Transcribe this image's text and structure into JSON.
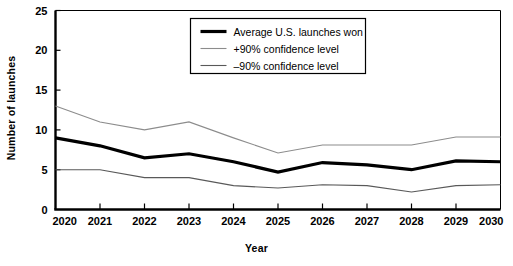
{
  "chart_data": {
    "type": "line",
    "title": "",
    "xlabel": "Year",
    "ylabel": "Number of launches",
    "categories": [
      "2020",
      "2021",
      "2022",
      "2023",
      "2024",
      "2025",
      "2026",
      "2027",
      "2028",
      "2029",
      "2030"
    ],
    "x": [
      2020,
      2021,
      2022,
      2023,
      2024,
      2025,
      2026,
      2027,
      2028,
      2029,
      2030
    ],
    "xlim": [
      2020,
      2030
    ],
    "ylim": [
      0,
      25
    ],
    "yticks": [
      0,
      5,
      10,
      15,
      20,
      25
    ],
    "ytick_labels": [
      "0",
      "5",
      "10",
      "15",
      "20",
      "25"
    ],
    "grid": false,
    "legend_position": "top-center",
    "series": [
      {
        "name": "Average U.S. launches won",
        "values": [
          9,
          8,
          6.5,
          7,
          6,
          4.7,
          5.9,
          5.6,
          5,
          6.1,
          6
        ],
        "color": "#000000",
        "width": 3.2
      },
      {
        "name": "+90% confidence level",
        "values": [
          13,
          11,
          10,
          11,
          9,
          7.1,
          8.1,
          8.1,
          8.1,
          9.1,
          9.1
        ],
        "color": "#8c8c8c",
        "width": 1.1
      },
      {
        "name": "–90% confidence level",
        "values": [
          5,
          5,
          4,
          4,
          3,
          2.7,
          3.1,
          3,
          2.2,
          3,
          3.1
        ],
        "color": "#595959",
        "width": 1.1
      }
    ]
  },
  "axes": {
    "y_title": "Number of launches",
    "x_title": "Year",
    "y_tick_labels": [
      "0",
      "5",
      "10",
      "15",
      "20",
      "25"
    ],
    "x_tick_labels": [
      "2020",
      "2021",
      "2022",
      "2023",
      "2024",
      "2025",
      "2026",
      "2027",
      "2028",
      "2029",
      "2030"
    ]
  },
  "legend": {
    "items": [
      {
        "label": "Average U.S. launches won",
        "color": "#000000",
        "width": 3.2
      },
      {
        "label": "+90% confidence level",
        "color": "#8c8c8c",
        "width": 1.1
      },
      {
        "label": "–90% confidence level",
        "color": "#595959",
        "width": 1.1
      }
    ]
  },
  "colors": {
    "background": "#ffffff",
    "axis": "#000000",
    "average_line": "#000000",
    "upper_bound": "#8c8c8c",
    "lower_bound": "#595959"
  }
}
